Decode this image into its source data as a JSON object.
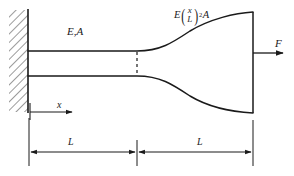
{
  "figure": {
    "background_color": "#ffffff",
    "line_color": "#1a1a1a",
    "hatch_color": "#555555"
  },
  "labels": {
    "uniform_section": {
      "text": "E,A",
      "base": "E",
      "subscript": "",
      "area": "A",
      "meaning": "modulus-E-area-A-uniform-segment"
    },
    "tapered_section": {
      "base": "E",
      "subscript": "",
      "numerator": "x",
      "denominator": "L",
      "exponent": "2",
      "area": "A",
      "plain_text": "E(x/L)^2 A",
      "meaning": "variable-area-parabolic-taper"
    },
    "force": {
      "text": "F",
      "meaning": "applied-axial-force-right-end"
    },
    "coordinate": {
      "text": "x",
      "meaning": "axial-coordinate-from-wall"
    },
    "dimension_left": {
      "text": "L",
      "meaning": "length-of-uniform-segment"
    },
    "dimension_right": {
      "text": "L",
      "meaning": "length-of-tapered-segment"
    }
  },
  "geometry": {
    "wall_x": 28,
    "wall_top": 10,
    "wall_bottom": 112,
    "bar_start_x": 28,
    "mid_x": 137,
    "bar_end_x": 253,
    "bar_top_y": 51,
    "bar_bottom_y": 76,
    "flare_top_y": 12,
    "flare_bottom_y": 113,
    "axis_arrow_y": 112,
    "dim_line_y": 152,
    "force_arrow_y": 53
  }
}
